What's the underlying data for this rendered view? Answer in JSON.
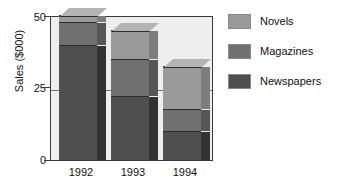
{
  "chart_data": {
    "type": "bar",
    "subtype": "stacked-3d-column",
    "title": "",
    "xlabel": "",
    "ylabel": "Sales ($000)",
    "categories": [
      "1992",
      "1993",
      "1994"
    ],
    "ylim": [
      0,
      50
    ],
    "yticks": [
      0,
      25,
      50
    ],
    "ytick_labels": [
      "0",
      "25",
      "50"
    ],
    "grid": true,
    "gridlines_at": [
      25
    ],
    "legend_position": "right",
    "series": [
      {
        "name": "Novels",
        "color": "#9a9a9a",
        "values": [
          2.5,
          10.0,
          15.0
        ]
      },
      {
        "name": "Magazines",
        "color": "#707070",
        "values": [
          8.0,
          13.0,
          7.5
        ]
      },
      {
        "name": "Newspapers",
        "color": "#4f4f4f",
        "values": [
          39.5,
          22.0,
          10.0
        ]
      }
    ],
    "stack_totals": [
      50.0,
      45.0,
      32.5
    ],
    "stack_order_bottom_to_top": [
      "Newspapers",
      "Magazines",
      "Novels"
    ]
  },
  "axes": {
    "y_title": "Sales ($000)",
    "y_tick_top": "50",
    "y_tick_mid": "25",
    "y_tick_bottom": "0",
    "x_tick_1": "1992",
    "x_tick_2": "1993",
    "x_tick_3": "1994"
  },
  "legend": {
    "items": [
      {
        "label": "Novels",
        "color": "#9a9a9a"
      },
      {
        "label": "Magazines",
        "color": "#707070"
      },
      {
        "label": "Newspapers",
        "color": "#4f4f4f"
      }
    ]
  },
  "colors": {
    "plot_background": "#eeeeee",
    "axis": "#3a3a3a",
    "gridline": "#6f6f6f",
    "novels": "#9a9a9a",
    "magazines": "#707070",
    "newspapers": "#4f4f4f",
    "novels_side": "#7d7d7d",
    "magazines_side": "#565656",
    "newspapers_side": "#323232",
    "novels_top": "#b4b4b4",
    "text": "#111111"
  }
}
